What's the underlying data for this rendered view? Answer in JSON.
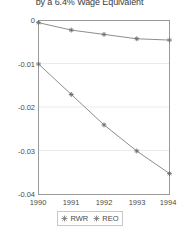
{
  "chart_data": {
    "type": "line",
    "title": "by a 6.4% Wage Equivalent",
    "xlabel": "",
    "ylabel": "",
    "x": [
      1990,
      1991,
      1992,
      1993,
      1994
    ],
    "xticklabels": [
      "1990",
      "1991",
      "1992",
      "1993",
      "1994"
    ],
    "yticklabels": [
      "0",
      "-0.01",
      "-0.02",
      "-0.03",
      "-0.04"
    ],
    "yticks": [
      0,
      -0.01,
      -0.02,
      -0.03,
      -0.04
    ],
    "xlim": [
      1990,
      1994
    ],
    "ylim": [
      -0.04,
      0
    ],
    "grid": true,
    "legend_position": "below-center",
    "series": [
      {
        "name": "RWR",
        "marker": "star",
        "color": "#808080",
        "values": [
          -0.0005,
          -0.0022,
          -0.0032,
          -0.0042,
          -0.0045
        ]
      },
      {
        "name": "REO",
        "marker": "star",
        "color": "#808080",
        "values": [
          -0.01,
          -0.017,
          -0.024,
          -0.03,
          -0.0352
        ]
      }
    ]
  },
  "legend": {
    "entries": [
      {
        "label": "RWR"
      },
      {
        "label": "REO"
      }
    ]
  },
  "colors": {
    "axis": "#9a9a9a",
    "grid": "#e8e8e8",
    "line": "#909090",
    "marker": "#707070",
    "text": "#4a4a4a"
  }
}
